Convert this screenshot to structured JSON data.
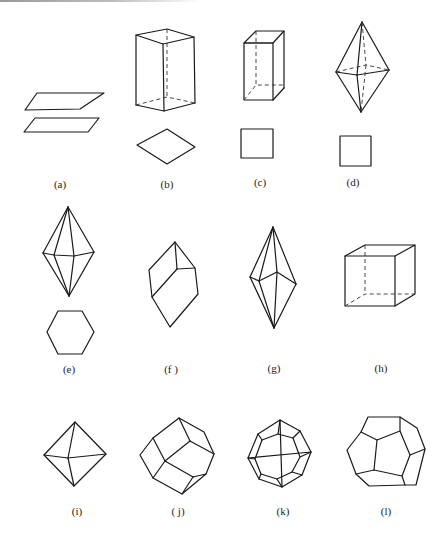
{
  "figure": {
    "panels": [
      {
        "id": "a",
        "label": "(a)",
        "shape": "pinacoid (two parallel planes)"
      },
      {
        "id": "b",
        "label": "(b)",
        "shape": "rhombic prism with rhombus cross-section"
      },
      {
        "id": "c",
        "label": "(c)",
        "shape": "tetragonal prism with square cross-section"
      },
      {
        "id": "d",
        "label": "(d)",
        "shape": "tetragonal dipyramid with square cross-section"
      },
      {
        "id": "e",
        "label": "(e)",
        "shape": "hexagonal dipyramid with hexagon cross-section"
      },
      {
        "id": "f",
        "label": "(f )",
        "shape": "rhombohedron"
      },
      {
        "id": "g",
        "label": "(g)",
        "shape": "trigonal trapezohedron / scalenohedron"
      },
      {
        "id": "h",
        "label": "(h)",
        "shape": "cube"
      },
      {
        "id": "i",
        "label": "(i)",
        "shape": "octahedron"
      },
      {
        "id": "j",
        "label": "( j)",
        "shape": "rhombic dodecahedron"
      },
      {
        "id": "k",
        "label": "(k)",
        "shape": "tetragonal trisoctahedron"
      },
      {
        "id": "l",
        "label": "(l)",
        "shape": "pentagonal dodecahedron"
      }
    ]
  }
}
